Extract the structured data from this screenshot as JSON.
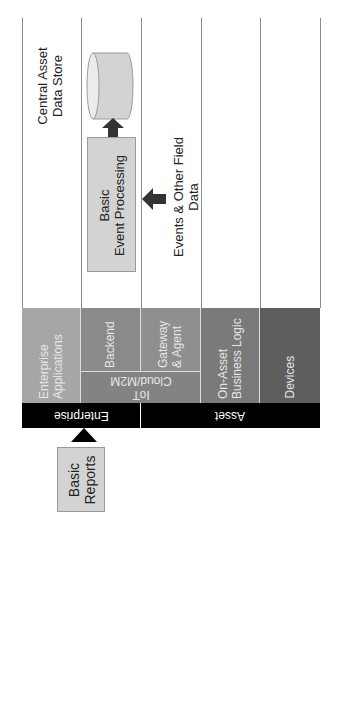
{
  "diagram": {
    "orientation": "rotated -90deg (text reads bottom-to-top)",
    "lanes": [
      {
        "id": "enterprise-applications",
        "label": "Enterprise\nApplications",
        "color": "#a6a6a6"
      },
      {
        "id": "backend",
        "label": "Backend",
        "color": "#8a8a8a"
      },
      {
        "id": "gateway-agent",
        "label": "Gateway\n& Agent",
        "color": "#8f8f8f"
      },
      {
        "id": "on-asset-business-logic",
        "label": "On-Asset\nBusiness Logic",
        "color": "#7a7a7a"
      },
      {
        "id": "devices",
        "label": "Devices",
        "color": "#5e5e5e"
      }
    ],
    "spanning_layer": {
      "label": "IoT\nCloud/M2M",
      "color": "#838383"
    },
    "groups": [
      {
        "label": "Enterprise"
      },
      {
        "label": "Asset"
      }
    ],
    "nodes": {
      "central_store_label": "Central Asset\nData Store",
      "event_processing": "Basic\nEvent Processing",
      "field_data_label": "Events & Other Field Data",
      "reports": "Basic\nReports"
    },
    "colors": {
      "line": "#8c8c8c",
      "node_fill": "#d3d3d3",
      "arrow": "#333333",
      "group_bar": "#000000"
    }
  }
}
